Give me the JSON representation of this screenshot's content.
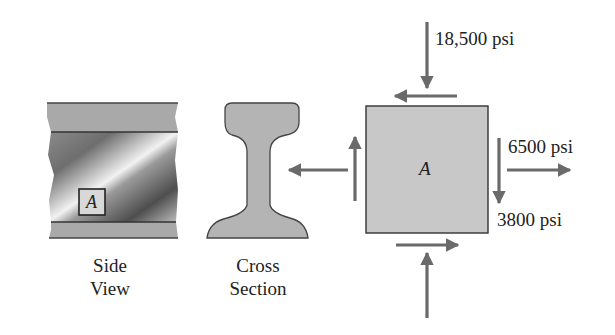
{
  "figure": {
    "side_view": {
      "caption_line1": "Side",
      "caption_line2": "View",
      "element_label": "A"
    },
    "cross_section": {
      "caption_line1": "Cross",
      "caption_line2": "Section"
    },
    "stress_element": {
      "label": "A",
      "normal_stress_vertical": "18,500 psi",
      "normal_stress_horizontal": "6500 psi",
      "shear_stress": "3800 psi"
    },
    "colors": {
      "arrow": "#6a6a6a",
      "element_fill": "#c8c8c8",
      "outline": "#333333",
      "band_fill": "#a9a9a9"
    }
  }
}
